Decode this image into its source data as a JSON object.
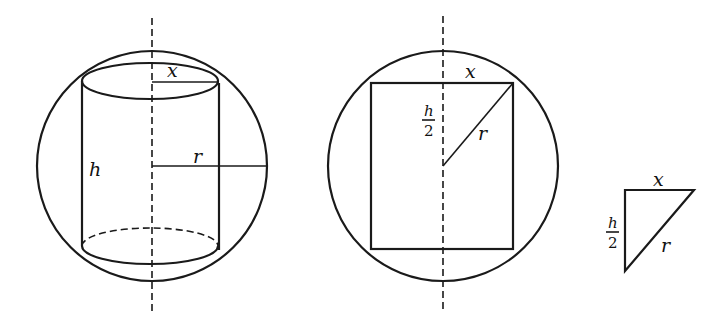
{
  "figure": {
    "panels": [
      {
        "name": "cylinder-in-sphere",
        "labels": {
          "x": "x",
          "h": "h",
          "r": "r"
        }
      },
      {
        "name": "cross-section",
        "labels": {
          "x": "x",
          "h_num": "h",
          "h_den": "2",
          "r": "r"
        }
      },
      {
        "name": "right-triangle",
        "labels": {
          "x": "x",
          "h_num": "h",
          "h_den": "2",
          "r": "r"
        }
      }
    ],
    "colors": {
      "line": "#1a1a1a",
      "background": "#ffffff"
    }
  }
}
